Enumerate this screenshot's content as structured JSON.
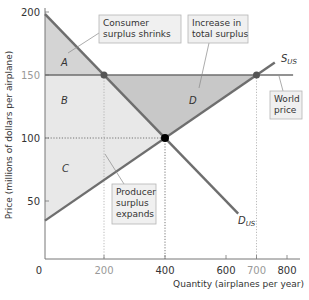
{
  "chart_data": {
    "type": "line",
    "title": "",
    "xlabel": "Quantity (airplanes per year)",
    "ylabel": "Price (millions of dollars per airplane)",
    "xlim": [
      0,
      850
    ],
    "ylim": [
      0,
      210
    ],
    "x_ticks": [
      {
        "value": 0,
        "label": "0",
        "muted": false
      },
      {
        "value": 200,
        "label": "200",
        "muted": true
      },
      {
        "value": 400,
        "label": "400",
        "muted": false
      },
      {
        "value": 600,
        "label": "600",
        "muted": false
      },
      {
        "value": 700,
        "label": "700",
        "muted": true
      },
      {
        "value": 800,
        "label": "800",
        "muted": false
      }
    ],
    "y_ticks": [
      {
        "value": 50,
        "label": "50",
        "muted": false
      },
      {
        "value": 100,
        "label": "100",
        "muted": false
      },
      {
        "value": 150,
        "label": "150",
        "muted": true
      },
      {
        "value": 200,
        "label": "200",
        "muted": false
      }
    ],
    "series": [
      {
        "name": "D_US",
        "label_main": "D",
        "label_sub": "US",
        "points": [
          [
            0,
            200
          ],
          [
            640,
            40
          ]
        ]
      },
      {
        "name": "S_US",
        "label_main": "S",
        "label_sub": "US",
        "points": [
          [
            0,
            33.3
          ],
          [
            760,
            160
          ]
        ]
      },
      {
        "name": "World price",
        "points": [
          [
            0,
            150
          ],
          [
            820,
            150
          ]
        ]
      }
    ],
    "equilibrium_no_trade": {
      "quantity": 400,
      "price": 100
    },
    "world_price": 150,
    "quantity_demanded_at_world_price": 200,
    "quantity_supplied_at_world_price": 700,
    "areas": [
      {
        "id": "A",
        "label": "A",
        "description": "Consumer surplus remaining"
      },
      {
        "id": "B",
        "label": "B",
        "description": "Transferred from consumers to producers"
      },
      {
        "id": "C",
        "label": "C",
        "description": "Original producer surplus"
      },
      {
        "id": "D",
        "label": "D",
        "description": "Increase in total surplus"
      }
    ],
    "annotations": [
      {
        "id": "consumer",
        "lines": [
          "Consumer",
          "surplus shrinks"
        ]
      },
      {
        "id": "total",
        "lines": [
          "Increase in",
          "total surplus"
        ]
      },
      {
        "id": "world",
        "lines": [
          "World",
          "price"
        ]
      },
      {
        "id": "producer",
        "lines": [
          "Producer",
          "surplus",
          "expands"
        ]
      }
    ],
    "colors": {
      "curve": "#6e6e6e",
      "area_A": "#d4d4d4",
      "area_BC": "#e8e8e8",
      "area_D": "#c8c8c8",
      "point": "#000000",
      "gray_point": "#555555"
    }
  }
}
